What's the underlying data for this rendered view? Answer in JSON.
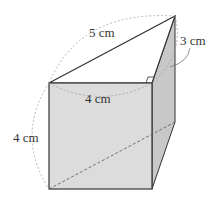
{
  "labels": {
    "hypotenuse": "5 cm",
    "depth": "3 cm",
    "width": "4 cm",
    "height": "4 cm"
  },
  "colors": {
    "front_face": "#dcdcdc",
    "side_face": "#c8c8c8",
    "top_face": "#ffffff",
    "edge": "#333333",
    "dashed": "#999999"
  }
}
